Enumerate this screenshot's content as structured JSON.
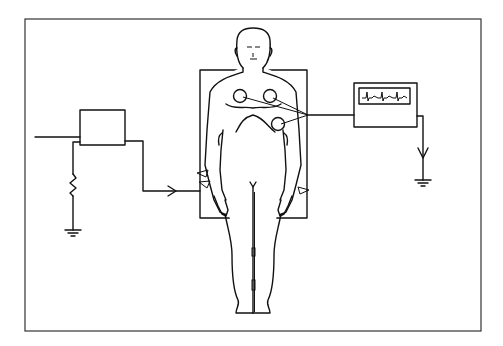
{
  "figure": {
    "type": "schematic illustration",
    "text_labels": [],
    "components": [
      {
        "id": "source-box",
        "description": "rectangular box (power source / generator)"
      },
      {
        "id": "resistor",
        "description": "zigzag resistor to ground on left"
      },
      {
        "id": "ground-left",
        "description": "earth ground symbol under resistor"
      },
      {
        "id": "lead-arrow",
        "description": "wire with arrow entering patient board"
      },
      {
        "id": "patient-board",
        "description": "rectangular board/plate behind patient torso"
      },
      {
        "id": "patient-figure",
        "description": "standing/lying human outline"
      },
      {
        "id": "chest-electrodes",
        "count": 3,
        "description": "circular ECG electrodes on chest"
      },
      {
        "id": "ecg-monitor",
        "description": "monitor box with ECG waveform display"
      },
      {
        "id": "ground-right",
        "description": "ground symbol with arrow from monitor"
      }
    ],
    "colors": {
      "line": "#111111",
      "background": "#ffffff",
      "frame": "#333333"
    }
  }
}
